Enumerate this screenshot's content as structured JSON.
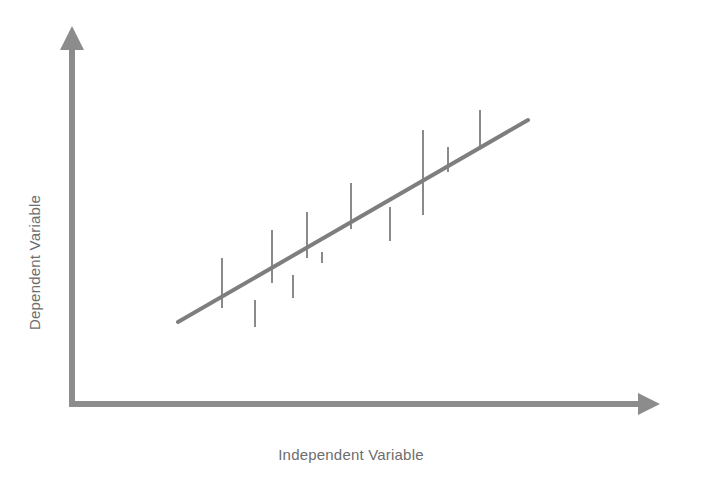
{
  "figure": {
    "width": 702,
    "height": 485,
    "background": "#ffffff"
  },
  "axes": {
    "x_label": "Independent Variable",
    "y_label": "Dependent Variable",
    "label_color": "#6d6d6d",
    "axis_color": "#8c8c8c",
    "origin_x": 72,
    "origin_y": 404,
    "x_arrow_tip_x": 660,
    "y_arrow_tip_y": 28
  },
  "line": {
    "color": "#7e7e7e",
    "width": 4,
    "x1": 178,
    "y1": 322,
    "x2": 528,
    "y2": 120
  },
  "residuals": {
    "color": "#8a8a8a",
    "width": 2
  },
  "chart_data": {
    "type": "scatter",
    "title": "",
    "subtitle": "",
    "xlabel": "Independent Variable",
    "ylabel": "Dependent Variable",
    "grid": false,
    "legend": "none",
    "axis_ticks": "none",
    "xlim": [
      0,
      100
    ],
    "ylim": [
      0,
      100
    ],
    "fit_line": {
      "name": "Best fit line",
      "x": [
        17.3,
        77.4
      ],
      "y": [
        21.8,
        75.5
      ],
      "slope": 0.894,
      "intercept": 6.34
    },
    "series": [
      {
        "name": "Observations",
        "note": "x,y in percent of plotting area; residual = observed y minus fitted y",
        "points": [
          {
            "x": 25.8,
            "y": 38.8,
            "fit_y": 29.4,
            "residual": 9.4
          },
          {
            "x": 31.4,
            "y": 20.4,
            "fit_y": 34.4,
            "residual": -14.0
          },
          {
            "x": 34.3,
            "y": 46.3,
            "fit_y": 37.0,
            "residual": 9.3
          },
          {
            "x": 37.9,
            "y": 21.3,
            "fit_y": 40.2,
            "residual": -18.9
          },
          {
            "x": 40.3,
            "y": 52.1,
            "fit_y": 42.4,
            "residual": 9.7
          },
          {
            "x": 42.9,
            "y": 30.3,
            "fit_y": 44.7,
            "residual": -14.4
          },
          {
            "x": 47.8,
            "y": 57.9,
            "fit_y": 49.1,
            "residual": 8.8
          },
          {
            "x": 54.4,
            "y": 41.7,
            "fit_y": 55.0,
            "residual": -13.3
          },
          {
            "x": 60.3,
            "y": 74.4,
            "fit_y": 60.3,
            "residual": 14.1
          },
          {
            "x": 63.9,
            "y": 65.8,
            "fit_y": 63.5,
            "residual": 2.3
          },
          {
            "x": 68.2,
            "y": 78.5,
            "fit_y": 67.3,
            "residual": 11.2
          }
        ]
      }
    ],
    "residual_segments": [
      {
        "x": 222,
        "y_top": 258,
        "y_bottom": 308
      },
      {
        "x": 255,
        "y_top": 300,
        "y_bottom": 327
      },
      {
        "x": 272,
        "y_top": 230,
        "y_bottom": 283
      },
      {
        "x": 293,
        "y_top": 275,
        "y_bottom": 298
      },
      {
        "x": 307,
        "y_top": 212,
        "y_bottom": 258
      },
      {
        "x": 322,
        "y_top": 252,
        "y_bottom": 263
      },
      {
        "x": 351,
        "y_top": 183,
        "y_bottom": 229
      },
      {
        "x": 390,
        "y_top": 207,
        "y_bottom": 241
      },
      {
        "x": 423,
        "y_top": 130,
        "y_bottom": 215
      },
      {
        "x": 448,
        "y_top": 147,
        "y_bottom": 172
      },
      {
        "x": 480,
        "y_top": 110,
        "y_bottom": 149
      }
    ]
  }
}
